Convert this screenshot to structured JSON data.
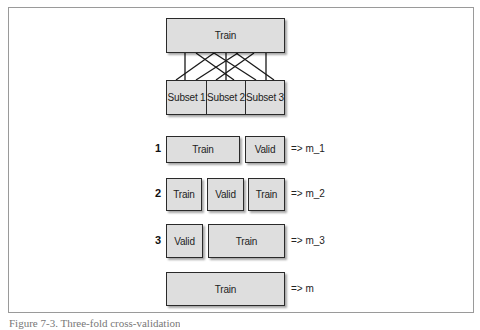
{
  "diagram": {
    "type": "k-fold cross-validation",
    "top_box": {
      "label": "Train"
    },
    "subsets": [
      {
        "label": "Subset 1"
      },
      {
        "label": "Subset 2"
      },
      {
        "label": "Subset 3"
      }
    ],
    "folds": [
      {
        "number": "1",
        "segments": [
          {
            "label": "Train",
            "role": "train"
          },
          {
            "label": "Valid",
            "role": "valid"
          }
        ],
        "result": "=> m_1"
      },
      {
        "number": "2",
        "segments": [
          {
            "label": "Train",
            "role": "train"
          },
          {
            "label": "Valid",
            "role": "valid"
          },
          {
            "label": "Train",
            "role": "train"
          }
        ],
        "result": "=> m_2"
      },
      {
        "number": "3",
        "segments": [
          {
            "label": "Valid",
            "role": "valid"
          },
          {
            "label": "Train",
            "role": "train"
          }
        ],
        "result": "=> m_3"
      }
    ],
    "final": {
      "label": "Train",
      "result": "=> m"
    }
  },
  "caption": "Figure 7-3. Three-fold cross-validation"
}
